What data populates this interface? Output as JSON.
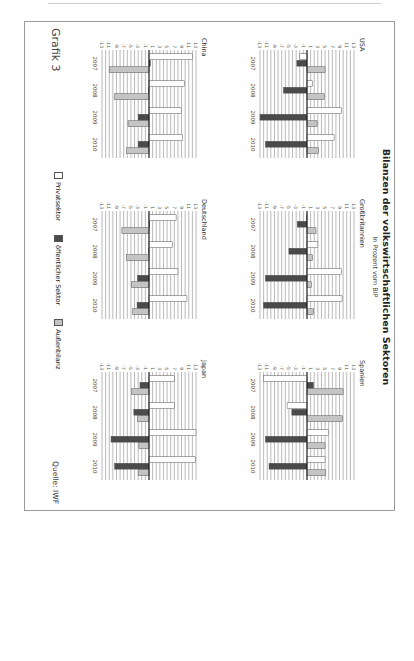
{
  "page": {
    "figure_label": "Grafik 3",
    "source": "Quelle: IWF"
  },
  "chart_data": {
    "type": "bar",
    "title": "Bilanzen der volkswirtschaftlichen Sektoren",
    "subtitle": "In Prozent vom BIP",
    "orientation_note": "image rotated 90° clockwise",
    "categories": [
      "2007",
      "2008",
      "2009",
      "2010"
    ],
    "ylim": [
      -13,
      13
    ],
    "yticks": [
      13,
      11,
      9,
      7,
      5,
      3,
      1,
      -1,
      -3,
      -5,
      -7,
      -9,
      -11,
      -13
    ],
    "grid": true,
    "legend": [
      {
        "name": "Privatsektor",
        "color": "#ffffff"
      },
      {
        "name": "öffentlicher Sektor",
        "color": "#4a4a4a"
      },
      {
        "name": "Außenbilanz",
        "color": "#c4c4c4"
      }
    ],
    "legend_position": "bottom",
    "panels": [
      {
        "name": "USA",
        "series": [
          {
            "name": "Privatsektor",
            "values": [
              -2,
              1.5,
              9.5,
              7.5
            ]
          },
          {
            "name": "öffentlicher Sektor",
            "values": [
              -2.8,
              -6.5,
              -13,
              -11.5
            ]
          },
          {
            "name": "Außenbilanz",
            "values": [
              5,
              4.8,
              2.8,
              3.2
            ]
          }
        ]
      },
      {
        "name": "Großbritannien",
        "series": [
          {
            "name": "Privatsektor",
            "values": [
              0,
              3,
              9.5,
              9.7
            ]
          },
          {
            "name": "öffentlicher Sektor",
            "values": [
              -2.7,
              -5,
              -11.5,
              -12
            ]
          },
          {
            "name": "Außenbilanz",
            "values": [
              2.5,
              1.5,
              1.2,
              1.8
            ]
          }
        ]
      },
      {
        "name": "Spanien",
        "series": [
          {
            "name": "Privatsektor",
            "values": [
              -12,
              -5.5,
              6,
              5
            ]
          },
          {
            "name": "öffentlicher Sektor",
            "values": [
              1.8,
              -4.2,
              -11.5,
              -10.5
            ]
          },
          {
            "name": "Außenbilanz",
            "values": [
              10,
              9.8,
              5,
              5.2
            ]
          }
        ]
      },
      {
        "name": "China",
        "series": [
          {
            "name": "Privatsektor",
            "values": [
              12,
              9.8,
              9,
              9.2
            ]
          },
          {
            "name": "öffentlicher Sektor",
            "values": [
              0.4,
              0,
              -3,
              -3
            ]
          },
          {
            "name": "Außenbilanz",
            "values": [
              -11,
              -9.5,
              -5.8,
              -6.2
            ]
          }
        ]
      },
      {
        "name": "Deutschland",
        "series": [
          {
            "name": "Privatsektor",
            "values": [
              7.5,
              6.5,
              8,
              10.5
            ]
          },
          {
            "name": "öffentlicher Sektor",
            "values": [
              0.2,
              0,
              -3.2,
              -3.3
            ]
          },
          {
            "name": "Außenbilanz",
            "values": [
              -7.5,
              -6.3,
              -4.8,
              -4.5
            ]
          }
        ]
      },
      {
        "name": "Japan",
        "series": [
          {
            "name": "Privatsektor",
            "values": [
              7,
              7,
              13,
              12.8
            ]
          },
          {
            "name": "öffentlicher Sektor",
            "values": [
              -2.5,
              -4.2,
              -10.5,
              -9.5
            ]
          },
          {
            "name": "Außenbilanz",
            "values": [
              -4.8,
              -3.2,
              -2.8,
              -3
            ]
          }
        ]
      }
    ]
  }
}
